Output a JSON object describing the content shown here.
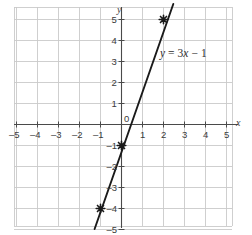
{
  "chart_data": {
    "type": "line",
    "title": "",
    "equation_label": "y = 3x − 1",
    "equation_parts": {
      "y": "y",
      "equals": "=",
      "slope": "3",
      "x": "x",
      "minus": "−",
      "intercept": "1"
    },
    "xlabel": "x",
    "ylabel": "y",
    "xlim": [
      -5.5,
      5.5
    ],
    "ylim": [
      -5.5,
      5.5
    ],
    "x_ticks": [
      -5,
      -4,
      -3,
      -2,
      -1,
      0,
      1,
      2,
      3,
      4,
      5
    ],
    "y_ticks": [
      -5,
      -4,
      -3,
      -2,
      -1,
      1,
      2,
      3,
      4,
      5
    ],
    "x_tick_labels": [
      "–5",
      "–4",
      "–3",
      "–2",
      "–1",
      "0",
      "1",
      "2",
      "3",
      "4",
      "5"
    ],
    "y_tick_labels": [
      "–5",
      "–4",
      "–3",
      "–2",
      "–1",
      "1",
      "2",
      "3",
      "4",
      "5"
    ],
    "origin_label": "0",
    "grid": true,
    "grid_color": "#c9c9c9",
    "axis_color": "#4a4a4a",
    "line_color": "#1a1a1a",
    "marker_color": "#1a1a1a",
    "marker_style": "star",
    "series": [
      {
        "name": "y = 3x − 1",
        "slope": 3,
        "intercept": -1,
        "points": [
          {
            "x": -1,
            "y": -4
          },
          {
            "x": 0,
            "y": -1
          },
          {
            "x": 2,
            "y": 5
          }
        ]
      }
    ],
    "legend": "none"
  }
}
